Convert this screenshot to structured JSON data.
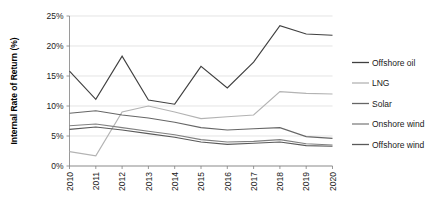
{
  "chart_data": {
    "type": "line",
    "title": "",
    "xlabel": "",
    "ylabel": "Internal Rate of Return (%)",
    "x": [
      "2010",
      "2011",
      "2012",
      "2013",
      "2014",
      "2015",
      "2016",
      "2017",
      "2018",
      "2019",
      "2020"
    ],
    "categories": [
      "2010",
      "2011",
      "2012",
      "2013",
      "2014",
      "2015",
      "2016",
      "2017",
      "2018",
      "2019",
      "2020"
    ],
    "ylim": [
      0,
      25
    ],
    "yticks": [
      0,
      5,
      10,
      15,
      20,
      25
    ],
    "ytick_labels": [
      "0%",
      "5%",
      "10%",
      "15%",
      "20%",
      "25%"
    ],
    "grid": true,
    "legend_position": "right",
    "series": [
      {
        "name": "Offshore oil",
        "color": "#404040",
        "values": [
          15.8,
          11.1,
          18.3,
          11.0,
          10.3,
          16.6,
          13.0,
          17.3,
          23.4,
          22.0,
          21.8
        ]
      },
      {
        "name": "LNG",
        "color": "#b3b3b3",
        "values": [
          2.4,
          1.7,
          9.0,
          10.0,
          9.0,
          7.9,
          8.2,
          8.5,
          12.4,
          12.1,
          12.0
        ]
      },
      {
        "name": "Solar",
        "color": "#666666",
        "values": [
          8.8,
          9.2,
          8.5,
          8.0,
          7.3,
          6.4,
          6.0,
          6.2,
          6.4,
          4.9,
          4.6
        ]
      },
      {
        "name": "Onshore wind",
        "color": "#808080",
        "values": [
          6.7,
          7.0,
          6.4,
          5.8,
          5.2,
          4.4,
          4.0,
          4.1,
          4.4,
          3.7,
          3.5
        ]
      },
      {
        "name": "Offshore wind",
        "color": "#595959",
        "values": [
          6.1,
          6.5,
          6.0,
          5.4,
          4.8,
          4.0,
          3.6,
          3.8,
          4.0,
          3.4,
          3.3
        ]
      }
    ]
  },
  "axis": {
    "y_title": "Internal Rate of Return (%)",
    "y_tick_labels": [
      "25%",
      "20%",
      "15%",
      "10%",
      "5%",
      "0%"
    ],
    "x_tick_labels": [
      "2010",
      "2011",
      "2012",
      "2013",
      "2014",
      "2015",
      "2016",
      "2017",
      "2018",
      "2019",
      "2020"
    ]
  },
  "legend": {
    "items": [
      {
        "label": "Offshore oil",
        "color": "#404040"
      },
      {
        "label": "LNG",
        "color": "#b3b3b3"
      },
      {
        "label": "Solar",
        "color": "#666666"
      },
      {
        "label": "Onshore wind",
        "color": "#808080"
      },
      {
        "label": "Offshore wind",
        "color": "#595959"
      }
    ]
  },
  "colors": {
    "gridline": "#d9d9d9",
    "axis": "#808080",
    "text": "#1a1a1a",
    "background": "#ffffff"
  }
}
